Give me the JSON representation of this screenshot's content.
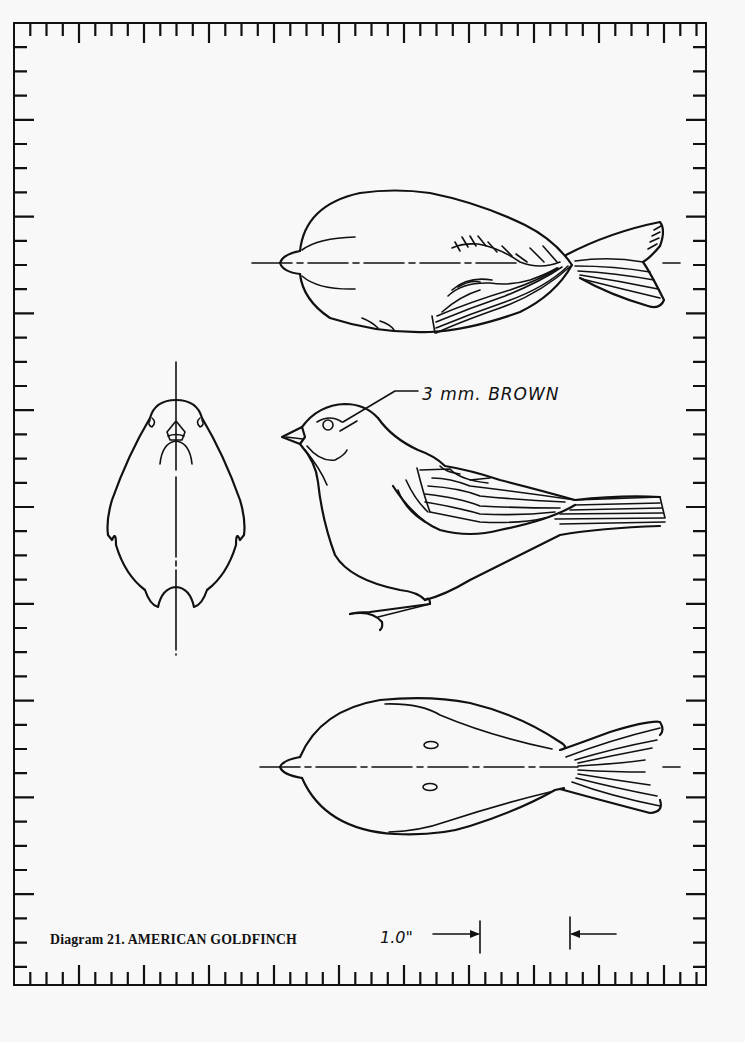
{
  "caption": "Diagram 21. AMERICAN GOLDFINCH",
  "annotations": {
    "eye_note": "3 mm. BROWN",
    "scale_label": "1.0\""
  },
  "views": [
    {
      "name": "top-view",
      "label": "Top view of bird (dorsal)"
    },
    {
      "name": "front-view",
      "label": "Front view of bird"
    },
    {
      "name": "side-view",
      "label": "Side profile of bird"
    },
    {
      "name": "bottom-view",
      "label": "Bottom view of bird (ventral)"
    }
  ],
  "frame": {
    "left": 14,
    "right": 706,
    "top": 23,
    "bottom": 985,
    "tick_spacing_x": 16.25,
    "tick_spacing_y": 24.2,
    "major_every": 4,
    "stroke_color": "#111111",
    "paper_color": "#f8f8f8"
  },
  "scale_bar": {
    "left_x": 480,
    "right_x": 570,
    "inches": 1.0
  }
}
